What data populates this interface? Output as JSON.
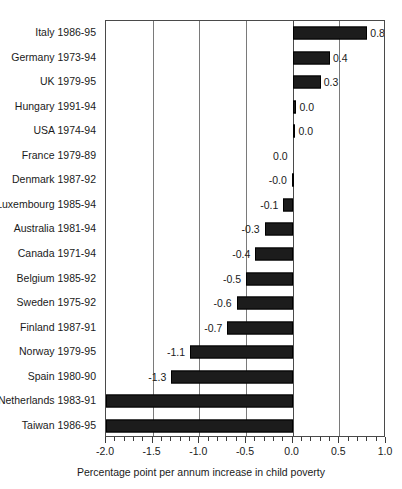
{
  "chart_data": {
    "type": "bar",
    "orientation": "horizontal",
    "title": "",
    "xlabel": "Percentage point per annum increase in child poverty",
    "ylabel": "",
    "xlim": [
      -2.0,
      1.0
    ],
    "grid": true,
    "legend": null,
    "bar_color": "#1c1c1c",
    "categories": [
      "Italy 1986-95",
      "Germany 1973-94",
      "UK 1979-95",
      "Hungary 1991-94",
      "USA 1974-94",
      "France 1979-89",
      "Denmark 1987-92",
      "Luxembourg 1985-94",
      "Australia 1981-94",
      "Canada 1971-94",
      "Belgium 1985-92",
      "Sweden 1975-92",
      "Finland 1987-91",
      "Norway 1979-95",
      "Spain 1980-90",
      "Netherlands 1983-91",
      "Taiwan 1986-95"
    ],
    "values": [
      0.8,
      0.4,
      0.3,
      0.04,
      0.03,
      0.0,
      -0.01,
      -0.1,
      -0.3,
      -0.4,
      -0.5,
      -0.6,
      -0.7,
      -1.1,
      -1.3,
      -2.6,
      -4.2
    ],
    "data_labels": [
      "0.8",
      "0.4",
      "0.3",
      "0.0",
      "0.0",
      "0.0",
      "-0.0",
      "-0.1",
      "-0.3",
      "-0.4",
      "-0.5",
      "-0.6",
      "-0.7",
      "-1.1",
      "-1.3",
      "-2.6",
      "-4.2"
    ],
    "xticks": [
      -2.0,
      -1.5,
      -1.0,
      -0.5,
      0.0,
      0.5,
      1.0
    ],
    "xtick_labels": [
      "-2.0",
      "-1.5",
      "-1.0",
      "-0.5",
      "0.0",
      "0.5",
      "1.0"
    ],
    "gridline_positions": [
      -1.5,
      -1.0,
      -0.5,
      0.0,
      0.5
    ],
    "zero_line": 0.0,
    "minor_ticks_per_interval": 5
  }
}
